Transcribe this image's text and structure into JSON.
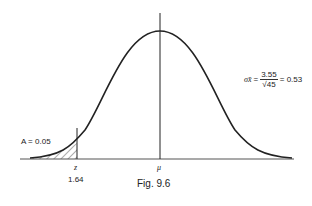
{
  "figure": {
    "caption": "Fig. 9.6",
    "area_label": "A = 0.05",
    "z_label": "z",
    "z_value": "1.64",
    "mean_label": "μ",
    "sigma": {
      "symbol": "σx̄",
      "equals1": "=",
      "numerator": "3.55",
      "denominator": "√45",
      "equals2": "= 0.53"
    }
  },
  "colors": {
    "curve": "#222222",
    "axis": "#555555",
    "hatch": "#333333"
  }
}
